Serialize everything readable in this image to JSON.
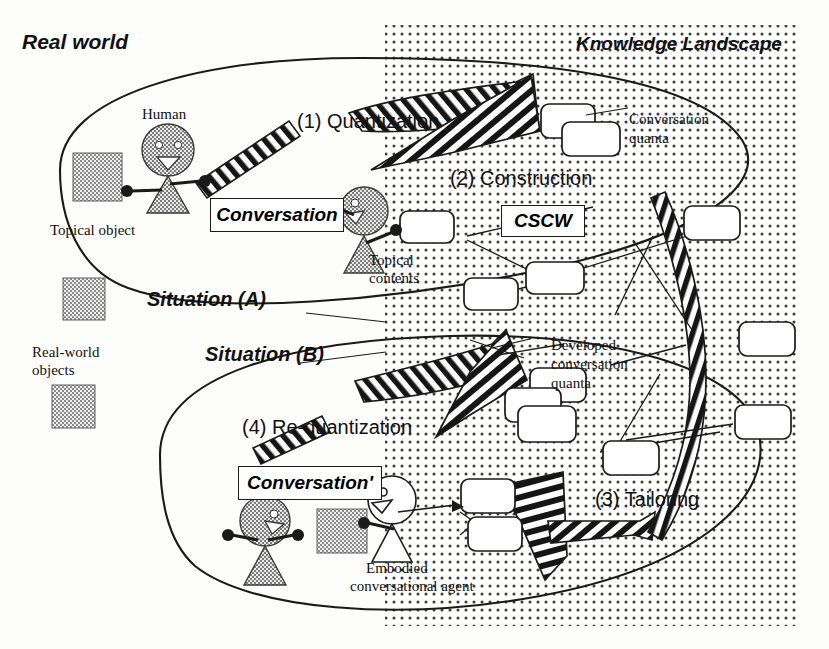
{
  "diagram": {
    "regions": {
      "real_world": "Real world",
      "knowledge_landscape": "Knowledge Landscape"
    },
    "situations": {
      "a": "Situation (A)",
      "b": "Situation (B)"
    },
    "steps": [
      {
        "id": "step-1",
        "label": "(1) Quantization"
      },
      {
        "id": "step-2",
        "label": "(2) Construction"
      },
      {
        "id": "step-3",
        "label": "(3) Tailoring"
      },
      {
        "id": "step-4",
        "label": "(4) Re-quantization"
      }
    ],
    "boxed_labels": [
      {
        "id": "conversation",
        "text": "Conversation"
      },
      {
        "id": "cscw",
        "text": "CSCW"
      },
      {
        "id": "conversation-prime",
        "text": "Conversation'"
      }
    ],
    "annotations": [
      {
        "id": "human",
        "text": "Human"
      },
      {
        "id": "topical-object",
        "text": "Topical object"
      },
      {
        "id": "topical-contents",
        "text": "Topical\ncontents"
      },
      {
        "id": "conversation-quanta",
        "text": "Conversation\nquanta"
      },
      {
        "id": "real-world-objects",
        "text": "Real-world\nobjects"
      },
      {
        "id": "developed-conversation-quanta",
        "text": "Developed\nconversation\nquanta"
      },
      {
        "id": "embodied-conversational-agent",
        "text": "Embodied\nconversational agent"
      }
    ],
    "annotation_lines": {
      "topical_contents_l1": "Topical",
      "topical_contents_l2": "contents",
      "conversation_quanta_l1": "Conversation",
      "conversation_quanta_l2": "quanta",
      "real_world_objects_l1": "Real-world",
      "real_world_objects_l2": "objects",
      "developed_l1": "Developed",
      "developed_l2": "conversation",
      "developed_l3": "quanta",
      "eca_l1": "Embodied",
      "eca_l2": "conversational agent"
    },
    "colors": {
      "ink": "#1a1a1a",
      "paper": "#fdfdfc",
      "dot_fill": "#3a3a3a",
      "object_fill": "#8f8f8f",
      "hatch_dark": "#151515"
    }
  }
}
